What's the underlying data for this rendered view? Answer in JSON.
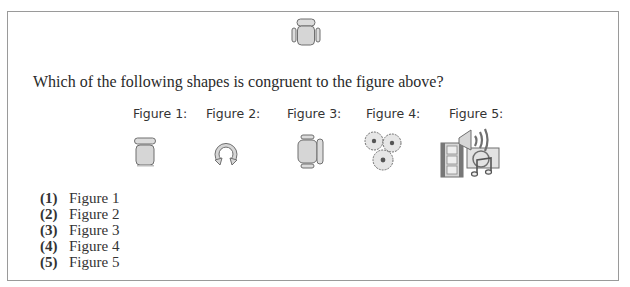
{
  "reference_figure": {
    "icon": "office-chair-top-view-icon",
    "orientation": "back-at-top"
  },
  "question": {
    "text": "Which of the following shapes is congruent to the figure above?"
  },
  "figures": [
    {
      "label": "Figure 1:",
      "icon": "chair-top-view-no-armrests-icon"
    },
    {
      "label": "Figure 2:",
      "icon": "circular-arrow-ring-icon"
    },
    {
      "label": "Figure 3:",
      "icon": "office-chair-rotated-icon"
    },
    {
      "label": "Figure 4:",
      "icon": "gears-icon"
    },
    {
      "label": "Figure 5:",
      "icon": "multimedia-film-speaker-music-icon"
    }
  ],
  "options": [
    {
      "number": "(1)",
      "text": "Figure 1"
    },
    {
      "number": "(2)",
      "text": "Figure 2"
    },
    {
      "number": "(3)",
      "text": "Figure 3"
    },
    {
      "number": "(4)",
      "text": "Figure 4"
    },
    {
      "number": "(5)",
      "text": "Figure 5"
    }
  ],
  "colors": {
    "border": "#9a9a9a",
    "icon_fill": "#d9d9d9",
    "icon_stroke": "#6f6f6f"
  }
}
